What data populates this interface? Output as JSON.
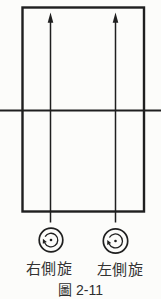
{
  "figure": {
    "caption": "圖 2-11",
    "labels": {
      "left_circle": "右側旋",
      "right_circle": "左側旋"
    },
    "icons": {
      "left_circle_symbol": "rotation-arrow-in-circle",
      "right_circle_symbol": "rotation-arrow-in-circle",
      "vertical_arrows": "up-arrow"
    },
    "colors": {
      "background": "#fcfcfa",
      "line": "#1f1f1f",
      "text": "#333333"
    }
  }
}
